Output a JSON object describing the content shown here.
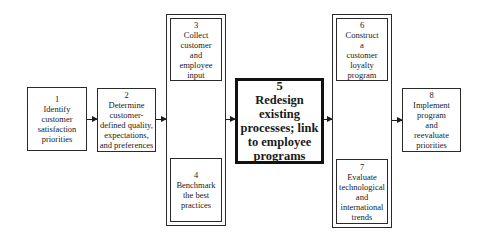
{
  "diagram": {
    "steps": [
      {
        "num": "1",
        "lines": [
          "Identify",
          "customer",
          "satisfaction",
          "priorities"
        ]
      },
      {
        "num": "2",
        "lines": [
          "Determine",
          "customer-",
          "defined quality,",
          "expectations,",
          "and preferences"
        ]
      },
      {
        "num": "3",
        "lines": [
          "Collect",
          "customer",
          "and",
          "employee",
          "input"
        ]
      },
      {
        "num": "4",
        "lines": [
          "Benchmark",
          "the best",
          "practices"
        ]
      },
      {
        "num": "5",
        "lines": [
          "Redesign",
          "existing",
          "processes; link",
          "to employee",
          "programs"
        ]
      },
      {
        "num": "6",
        "lines": [
          "Construct",
          "a",
          "customer",
          "loyalty",
          "program"
        ]
      },
      {
        "num": "7",
        "lines": [
          "Evaluate",
          "technological",
          "and",
          "international",
          "trends"
        ]
      },
      {
        "num": "8",
        "lines": [
          "Implement",
          "program",
          "and",
          "reevaluate",
          "priorities"
        ]
      }
    ],
    "connections": [
      {
        "from": "1",
        "to": "2"
      },
      {
        "from": "2",
        "to": "3-4"
      },
      {
        "from": "3-4",
        "to": "5"
      },
      {
        "from": "5",
        "to": "6-7"
      },
      {
        "from": "6-7",
        "to": "8"
      }
    ]
  }
}
